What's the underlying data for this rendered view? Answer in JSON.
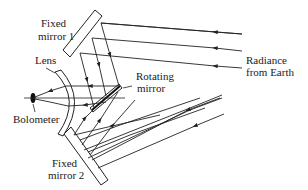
{
  "diagram": {
    "labels": {
      "fixed_mirror_1_line1": "Fixed",
      "fixed_mirror_1_line2": "mirror 1",
      "lens": "Lens",
      "rotating_mirror_line1": "Rotating",
      "rotating_mirror_line2": "mirror",
      "radiance_line1": "Radiance",
      "radiance_line2": "from Earth",
      "bolometer": "Bolometer",
      "fixed_mirror_2_line1": "Fixed",
      "fixed_mirror_2_line2": "mirror 2"
    },
    "colors": {
      "line": "#222222",
      "background": "#ffffff"
    }
  }
}
